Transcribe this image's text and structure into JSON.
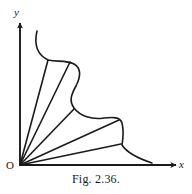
{
  "figure": {
    "caption": "Fig. 2.36.",
    "axes": {
      "x_label": "x",
      "y_label": "y",
      "origin_label": "O",
      "origin": [
        20,
        165
      ],
      "x_axis_end": [
        178,
        165
      ],
      "y_axis_end": [
        20,
        21
      ],
      "stroke_color": "#1a1a1a"
    },
    "curve": {
      "description": "closed region boundary in first quadrant",
      "stroke_color": "#1a1a1a",
      "stroke_width": 1.6,
      "path": "M 37 31 C 34 44, 36 54, 48 60 C 58 62, 66 60, 74 64 C 81 68, 81 76, 76 86 C 71 95, 69 101, 74 108 C 80 116, 92 120, 104 118 C 114 117, 120 117, 122 123 C 124 131, 123 139, 122 145 C 127 153, 140 159, 152 163"
    },
    "rays": [
      {
        "name": "ray-1",
        "from": [
          20,
          165
        ],
        "to": [
          48,
          60
        ]
      },
      {
        "name": "ray-2",
        "from": [
          20,
          165
        ],
        "to": [
          70,
          62
        ]
      },
      {
        "name": "ray-3",
        "from": [
          20,
          165
        ],
        "to": [
          74,
          109
        ]
      },
      {
        "name": "ray-4",
        "from": [
          20,
          165
        ],
        "to": [
          119,
          120
        ]
      },
      {
        "name": "ray-5",
        "from": [
          20,
          165
        ],
        "to": [
          121,
          144
        ]
      }
    ]
  }
}
